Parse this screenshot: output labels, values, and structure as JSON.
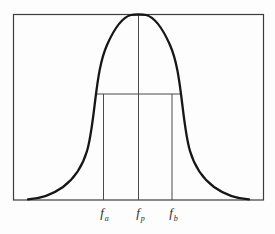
{
  "figure": {
    "x_axis_labels": [
      {
        "base": "f",
        "subscript": "a"
      },
      {
        "base": "f",
        "subscript": "p"
      },
      {
        "base": "f",
        "subscript": "b"
      }
    ],
    "colors": {
      "background": "#fdfdfd",
      "frame": "#3c3c3c",
      "curve": "#161616",
      "guide_lines": "#4a4a4a",
      "label_text": "#2a2a2a"
    }
  }
}
